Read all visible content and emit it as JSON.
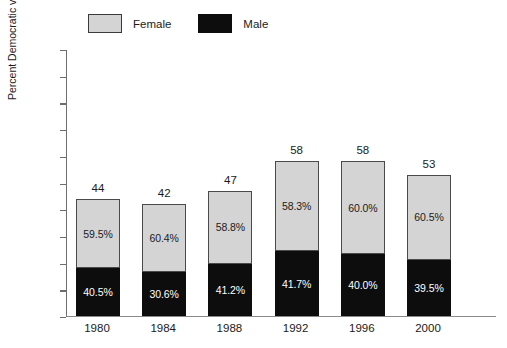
{
  "chart_data": {
    "type": "bar",
    "subtype": "stacked-bar-100-percent-labeled",
    "title": "",
    "xlabel": "",
    "ylabel": "Percent Democratic vote",
    "ylim": [
      0,
      100
    ],
    "yticks": [
      0,
      10,
      20,
      30,
      40,
      50,
      60,
      70,
      80,
      90,
      100
    ],
    "grid": false,
    "legend_position": "top-left",
    "categories": [
      "1980",
      "1984",
      "1988",
      "1992",
      "1996",
      "2000"
    ],
    "totals": [
      44,
      42,
      47,
      58,
      58,
      53
    ],
    "total_labels": [
      "44",
      "42",
      "47",
      "58",
      "58",
      "53"
    ],
    "series": [
      {
        "name": "Female",
        "color": "#d4d4d4",
        "share_labels": [
          "59.5%",
          "60.4%",
          "58.8%",
          "58.3%",
          "60.0%",
          "60.5%"
        ],
        "shares": [
          59.5,
          60.4,
          58.8,
          58.3,
          60.0,
          60.5
        ],
        "values": [
          26.2,
          25.4,
          27.6,
          33.8,
          34.8,
          32.1
        ]
      },
      {
        "name": "Male",
        "color": "#0d0d0d",
        "share_labels": [
          "40.5%",
          "30.6%",
          "41.2%",
          "41.7%",
          "40.0%",
          "39.5%"
        ],
        "shares": [
          40.5,
          30.6,
          41.2,
          41.7,
          40.0,
          39.5
        ],
        "values": [
          17.8,
          16.6,
          19.4,
          24.2,
          23.2,
          20.9
        ]
      }
    ]
  },
  "legend": {
    "items": [
      {
        "label": "Female",
        "color": "#d4d4d4"
      },
      {
        "label": "Male",
        "color": "#0d0d0d"
      }
    ]
  },
  "axes": {
    "y_title": "Percent Democratic vote",
    "y_tick_labels": [
      "100",
      "90",
      "80",
      "70",
      "60",
      "50",
      "40",
      "30",
      "20",
      "10",
      "0"
    ],
    "x_tick_labels": [
      "1980",
      "1984",
      "1988",
      "1992",
      "1996",
      "2000"
    ]
  }
}
